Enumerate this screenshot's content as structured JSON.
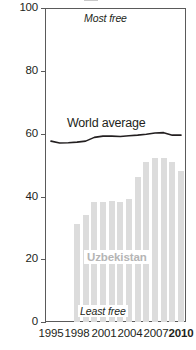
{
  "chart_data": {
    "type": "bar",
    "title": "",
    "xlabel": "",
    "ylabel": "",
    "ylim": [
      0,
      100
    ],
    "xlim": [
      1995,
      2011
    ],
    "grid": false,
    "legend": "inline-labels",
    "y_ticks": [
      "0",
      "20",
      "40",
      "60",
      "80",
      "100"
    ],
    "y_tick_values": [
      0,
      20,
      40,
      60,
      80,
      100
    ],
    "x_ticks": [
      "1995",
      "1998",
      "2001",
      "2004",
      "2007",
      "2010"
    ],
    "x_tick_values": [
      1995,
      1998,
      2001,
      2004,
      2007,
      2010
    ],
    "annotations": {
      "top": "Most free",
      "bottom": "Least free"
    },
    "series": [
      {
        "name": "Uzbekistan",
        "type": "bar",
        "color": "#dcdcdc",
        "label": "Uzbekistan",
        "x": [
          1998,
          1999,
          2000,
          2001,
          2002,
          2003,
          2004,
          2005,
          2006,
          2007,
          2008,
          2009,
          2010
        ],
        "values": [
          31.3,
          34.0,
          38.2,
          38.2,
          38.5,
          38.2,
          39.1,
          46.2,
          51.0,
          52.2,
          52.2,
          51.0,
          48.0
        ]
      },
      {
        "name": "World average",
        "type": "line",
        "color": "#231f20",
        "label": "World average",
        "x": [
          1995,
          1996,
          1997,
          1998,
          1999,
          2000,
          2001,
          2002,
          2003,
          2004,
          2005,
          2006,
          2007,
          2008,
          2009,
          2010
        ],
        "values": [
          57.6,
          57.0,
          57.1,
          57.3,
          57.6,
          58.8,
          59.2,
          59.2,
          59.1,
          59.3,
          59.5,
          59.8,
          60.2,
          60.3,
          59.5,
          59.5
        ]
      }
    ]
  },
  "axes": {
    "y_labels": [
      {
        "text": "100",
        "value": 100
      },
      {
        "text": "80",
        "value": 80
      },
      {
        "text": "60",
        "value": 60
      },
      {
        "text": "40",
        "value": 40
      },
      {
        "text": "20",
        "value": 20
      },
      {
        "text": "0",
        "value": 0
      }
    ],
    "x_labels": [
      {
        "text": "1995",
        "value": 1995,
        "bold": false
      },
      {
        "text": "1998",
        "value": 1998,
        "bold": false
      },
      {
        "text": "2001",
        "value": 2001,
        "bold": false
      },
      {
        "text": "2004",
        "value": 2004,
        "bold": false
      },
      {
        "text": "2007",
        "value": 2007,
        "bold": false
      },
      {
        "text": "2010",
        "value": 2010,
        "bold": true
      }
    ]
  },
  "labels": {
    "most_free": "Most free",
    "least_free": "Least free",
    "world_average": "World average",
    "country": "Uzbekistan"
  },
  "colors": {
    "bar": "#dcdcdc",
    "line": "#231f20",
    "axis": "#5a5a5a",
    "text": "#231f20",
    "country_label": "#b5b5b5",
    "background": "#ffffff"
  }
}
